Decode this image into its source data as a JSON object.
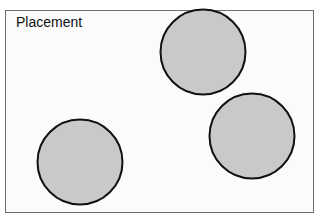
{
  "title": "Placement",
  "colors": {
    "circle_fill": "#c9c9c9",
    "circle_stroke": "#111111",
    "frame_border": "#6e6e6e",
    "background": "#fbfbfb"
  },
  "circles": [
    {
      "name": "circle-top",
      "cx": 203,
      "cy": 52
    },
    {
      "name": "circle-right",
      "cx": 252,
      "cy": 136
    },
    {
      "name": "circle-bottom-left",
      "cx": 80,
      "cy": 162
    }
  ]
}
